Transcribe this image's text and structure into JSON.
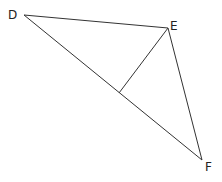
{
  "diagram": {
    "type": "triangle-with-altitude",
    "points": {
      "D": {
        "x": 24,
        "y": 15,
        "label": "D",
        "lx": 8,
        "ly": 19
      },
      "E": {
        "x": 168,
        "y": 28,
        "label": "E",
        "lx": 170,
        "ly": 30
      },
      "F": {
        "x": 202,
        "y": 160,
        "label": "F",
        "lx": 205,
        "ly": 171
      },
      "H": {
        "x": 119,
        "y": 93
      }
    },
    "segments": [
      {
        "from": "D",
        "to": "E"
      },
      {
        "from": "E",
        "to": "F"
      },
      {
        "from": "D",
        "to": "F"
      },
      {
        "from": "E",
        "to": "H"
      }
    ]
  }
}
